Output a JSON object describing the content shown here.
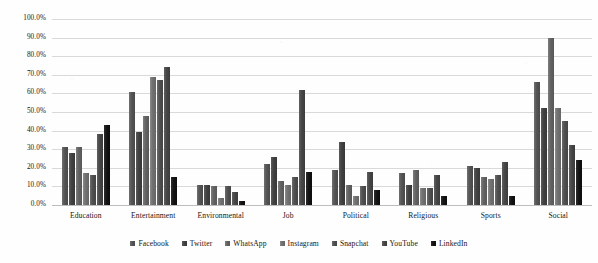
{
  "chart_data": {
    "type": "bar",
    "title": "",
    "xlabel": "",
    "ylabel": "",
    "ylim": [
      0,
      100
    ],
    "y_tick_labels": [
      "100.0%",
      "90.0%",
      "80.0%",
      "70.0%",
      "60.0%",
      "50.0%",
      "40.0%",
      "30.0%",
      "20.0%",
      "10.0%",
      "0.0%"
    ],
    "y_tick_values": [
      100,
      90,
      80,
      70,
      60,
      50,
      40,
      30,
      20,
      10,
      0
    ],
    "grid": true,
    "legend_position": "bottom",
    "categories": [
      "Education",
      "Entertainment",
      "Environmental",
      "Job",
      "Political",
      "Religious",
      "Sports",
      "Social"
    ],
    "series": [
      {
        "name": "Facebook",
        "color": "#545454",
        "values": [
          31,
          61,
          11,
          22,
          19,
          17,
          21,
          66
        ]
      },
      {
        "name": "Twitter",
        "color": "#414141",
        "values": [
          28,
          39,
          11,
          26,
          34,
          11,
          20,
          52
        ]
      },
      {
        "name": "WhatsApp",
        "color": "#626262",
        "values": [
          31,
          48,
          10,
          13,
          11,
          19,
          15,
          90
        ]
      },
      {
        "name": "Instagram",
        "color": "#707070",
        "values": [
          17,
          69,
          4,
          11,
          5,
          9,
          14,
          52
        ]
      },
      {
        "name": "Snapchat",
        "color": "#4f4f4f",
        "values": [
          16,
          67,
          10,
          15,
          10,
          9,
          16,
          45
        ]
      },
      {
        "name": "YouTube",
        "color": "#464646",
        "values": [
          38,
          74,
          7,
          62,
          18,
          16,
          23,
          32
        ]
      },
      {
        "name": "LinkedIn",
        "color": "#141414",
        "values": [
          43,
          15,
          2,
          18,
          8,
          5,
          5,
          24
        ]
      }
    ]
  },
  "top_cropped_text": "· · ·"
}
